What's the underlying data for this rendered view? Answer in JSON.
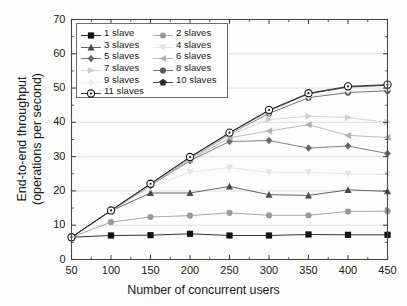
{
  "chart_data": {
    "type": "line",
    "title": "",
    "xlabel": "Number of concurrent users",
    "ylabel": "End-to-end throughput (operations per second)",
    "ylabel_line1": "End-to-end throughput",
    "ylabel_line2": "(operations per second)",
    "x": [
      50,
      100,
      150,
      200,
      250,
      300,
      350,
      400,
      450
    ],
    "xlim": [
      50,
      450
    ],
    "ylim": [
      0,
      70
    ],
    "xticks": [
      50,
      100,
      150,
      200,
      250,
      300,
      350,
      400,
      450
    ],
    "yticks": [
      0,
      10,
      20,
      30,
      40,
      50,
      60,
      70
    ],
    "xtick_labels": [
      "50",
      "100",
      "150",
      "200",
      "250",
      "300",
      "350",
      "400",
      "450"
    ],
    "ytick_labels": [
      "0",
      "10",
      "20",
      "30",
      "40",
      "50",
      "60",
      "70"
    ],
    "grid": true,
    "grid_axis": "y",
    "legend_position": "upper-left-inside",
    "series": [
      {
        "name": "1 slave",
        "label": "1 slave",
        "marker": "square",
        "color": "#101010",
        "values": [
          6.5,
          7.0,
          7.1,
          7.5,
          7.0,
          7.0,
          7.3,
          7.2,
          7.2
        ]
      },
      {
        "name": "2 slaves",
        "label": "2 slaves",
        "marker": "circle",
        "color": "#9a9a9a",
        "values": [
          6.5,
          10.9,
          12.4,
          12.8,
          13.6,
          12.9,
          12.9,
          14.0,
          14.1
        ]
      },
      {
        "name": "3 slaves",
        "label": "3 slaves",
        "marker": "triangle-up",
        "color": "#4a4a4a",
        "values": [
          6.5,
          14.2,
          19.4,
          19.4,
          21.3,
          18.9,
          18.7,
          20.3,
          19.9
        ]
      },
      {
        "name": "4 slaves",
        "label": "4 slaves",
        "marker": "triangle-down",
        "color": "#e2e2e2",
        "values": [
          6.5,
          14.2,
          21.0,
          25.5,
          26.8,
          25.4,
          25.4,
          25.0,
          24.8
        ]
      },
      {
        "name": "5 slaves",
        "label": "5 slaves",
        "marker": "diamond",
        "color": "#6a6a6a",
        "values": [
          6.5,
          14.2,
          21.6,
          28.8,
          34.4,
          34.7,
          32.5,
          33.1,
          30.9
        ]
      },
      {
        "name": "6 slaves",
        "label": "6 slaves",
        "marker": "triangle-left",
        "color": "#b0b0b0",
        "values": [
          6.5,
          14.2,
          21.8,
          29.0,
          35.5,
          37.5,
          39.3,
          36.2,
          35.6
        ]
      },
      {
        "name": "7 slaves",
        "label": "7 slaves",
        "marker": "triangle-right",
        "color": "#cfcfcf",
        "values": [
          6.5,
          14.2,
          21.9,
          29.2,
          36.3,
          40.8,
          41.8,
          41.4,
          40.0
        ]
      },
      {
        "name": "8 slaves",
        "label": "8 slaves",
        "marker": "circle",
        "color": "#5a5a5a",
        "values": [
          6.5,
          14.2,
          22.0,
          29.5,
          36.6,
          42.6,
          47.2,
          48.7,
          49.2
        ]
      },
      {
        "name": "9 slaves",
        "label": "9 slaves",
        "marker": "diamond",
        "color": "#ededed",
        "values": [
          6.5,
          14.2,
          22.0,
          29.6,
          36.7,
          42.9,
          47.6,
          49.3,
          49.8
        ]
      },
      {
        "name": "10 slaves",
        "label": "10 slaves",
        "marker": "pentagon",
        "color": "#2a2a2a",
        "values": [
          6.5,
          14.3,
          22.1,
          29.8,
          36.9,
          43.4,
          48.3,
          50.3,
          50.8
        ]
      },
      {
        "name": "11 slaves",
        "label": "11 slaves",
        "marker": "circle-open",
        "color": "#1a1a1a",
        "values": [
          6.5,
          14.3,
          22.1,
          29.9,
          37.0,
          43.6,
          48.5,
          50.5,
          51.0
        ]
      }
    ]
  },
  "legend": {
    "order": [
      "1 slave",
      "2 slaves",
      "3 slaves",
      "4 slaves",
      "5 slaves",
      "6 slaves",
      "7 slaves",
      "8 slaves",
      "9 slaves",
      "10 slaves",
      "11 slaves"
    ]
  },
  "axes": {
    "x_title": "Number of concurrent users",
    "y_title_line1": "End-to-end throughput",
    "y_title_line2": "(operations per second)"
  }
}
